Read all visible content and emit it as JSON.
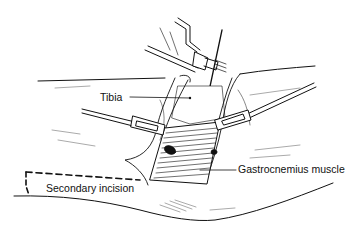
{
  "figure": {
    "type": "surgical illustration",
    "stroke_color": "#111111",
    "background_color": "#ffffff"
  },
  "labels": {
    "tibia": "Tibia",
    "gastrocnemius": "Gastrocnemius muscle",
    "secondary_incision": "Secondary incision"
  }
}
